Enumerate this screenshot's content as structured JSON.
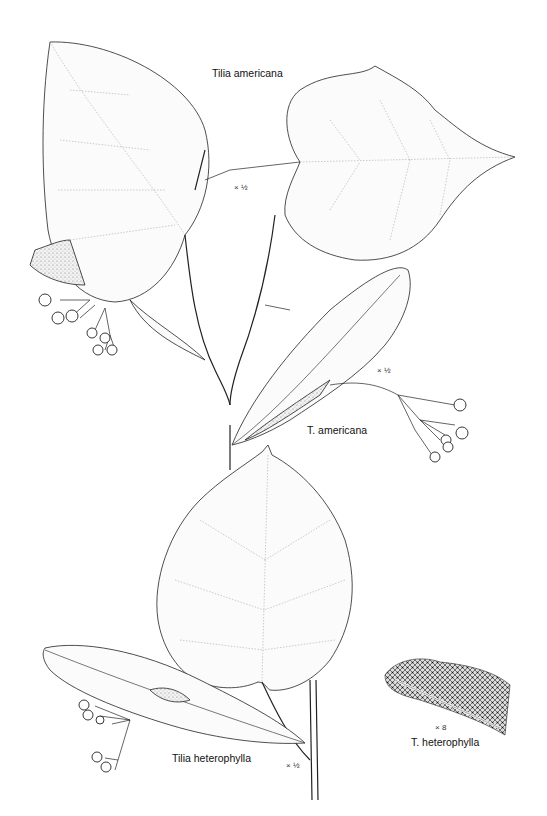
{
  "plate": {
    "background": "#ffffff",
    "ink_color": "#222222",
    "labels": {
      "top_title": "Tilia americana",
      "top_scale": "× ½",
      "middle_title": "T. americana",
      "middle_scale": "× ½",
      "bottom_title": "Tilia heterophylla",
      "bottom_scale": "× ½",
      "detail_scale": "× 8",
      "detail_title": "T. heterophylla"
    },
    "figures": [
      {
        "name": "tilia-americana-branch",
        "description": "Two heart-shaped serrate leaves on a forked twig with fruit cluster and bract"
      },
      {
        "name": "t-americana-fruit-bract",
        "description": "Elongated bract with peduncle and cluster of round fruits"
      },
      {
        "name": "tilia-heterophylla-branch",
        "description": "Heart-shaped leaf with bract and fruit cluster"
      },
      {
        "name": "t-heterophylla-leaf-underside-detail",
        "description": "Magnified hairy leaf underside texture"
      }
    ]
  }
}
